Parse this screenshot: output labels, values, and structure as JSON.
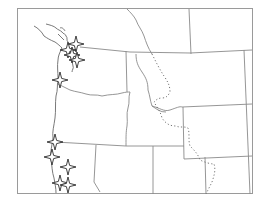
{
  "map": {
    "type": "regional-outline-map",
    "region": "Pacific Northwest / Northern Rockies",
    "frame": {
      "x": 17,
      "y": 8,
      "width": 236,
      "height": 186
    },
    "colors": {
      "background": "#ffffff",
      "border": "#8a8a8a",
      "marker_stroke": "#2a2a2a",
      "marker_fill": "#ffffff"
    },
    "markers": [
      {
        "id": "m1",
        "icon": "four-point-star-icon",
        "x": 76,
        "y": 44
      },
      {
        "id": "m2",
        "icon": "four-point-star-icon",
        "x": 68,
        "y": 50
      },
      {
        "id": "m3",
        "icon": "four-point-star-icon",
        "x": 72,
        "y": 55
      },
      {
        "id": "m4",
        "icon": "four-point-star-icon",
        "x": 77,
        "y": 60
      },
      {
        "id": "m5",
        "icon": "four-point-star-icon",
        "x": 60,
        "y": 80
      },
      {
        "id": "m6",
        "icon": "four-point-star-icon",
        "x": 55,
        "y": 142
      },
      {
        "id": "m7",
        "icon": "four-point-star-icon",
        "x": 52,
        "y": 157
      },
      {
        "id": "m8",
        "icon": "four-point-star-icon",
        "x": 68,
        "y": 167
      },
      {
        "id": "m9",
        "icon": "four-point-star-icon",
        "x": 60,
        "y": 183
      },
      {
        "id": "m10",
        "icon": "four-point-star-icon",
        "x": 68,
        "y": 185
      }
    ],
    "legend": null
  }
}
